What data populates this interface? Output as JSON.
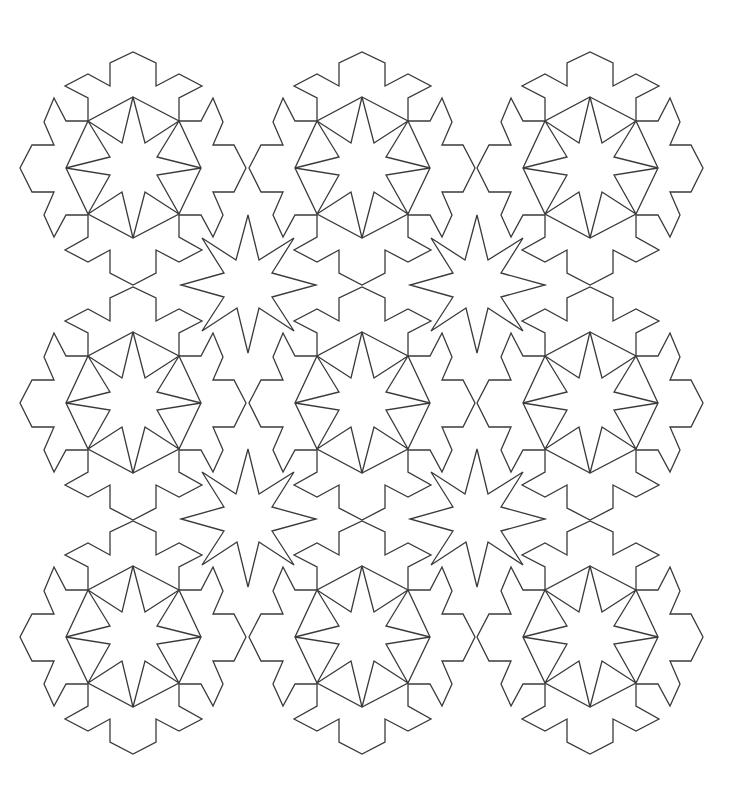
{
  "diagram": {
    "type": "geometric-tessellation",
    "background_color": "#ffffff",
    "line_color": "#3a3a3a",
    "line_width": 1.3,
    "rosettes": {
      "centers": [
        [
          133,
          168
        ],
        [
          362,
          168
        ],
        [
          590,
          168
        ],
        [
          133,
          403
        ],
        [
          362,
          403
        ],
        [
          590,
          403
        ],
        [
          133,
          637
        ],
        [
          362,
          637
        ],
        [
          590,
          637
        ]
      ],
      "octagon": [
        [
          0,
          -71
        ],
        [
          46,
          -47
        ],
        [
          68,
          0
        ],
        [
          46,
          46
        ],
        [
          0,
          70
        ],
        [
          -45,
          46
        ],
        [
          -67,
          0
        ],
        [
          -45,
          -47
        ]
      ],
      "inner_star": [
        [
          12,
          -25
        ],
        [
          24,
          -11
        ],
        [
          24,
          7
        ],
        [
          12,
          24
        ],
        [
          -11,
          24
        ],
        [
          -23,
          7
        ],
        [
          -23,
          -11
        ],
        [
          -11,
          -25
        ]
      ],
      "outline": [
        [
          -45,
          -47
        ],
        [
          -45,
          -70
        ],
        [
          -68,
          -82
        ],
        [
          -45,
          -94
        ],
        [
          -23,
          -82
        ],
        [
          -23,
          -105
        ],
        [
          0,
          -116
        ],
        [
          23,
          -105
        ],
        [
          23,
          -82
        ],
        [
          46,
          -94
        ],
        [
          69,
          -82
        ],
        [
          46,
          -70
        ],
        [
          46,
          -47
        ],
        [
          68,
          -47
        ],
        [
          80,
          -70
        ],
        [
          90,
          -46
        ],
        [
          80,
          -23
        ],
        [
          101,
          -23
        ],
        [
          113,
          0
        ],
        [
          101,
          24
        ],
        [
          80,
          24
        ],
        [
          90,
          47
        ],
        [
          80,
          69
        ],
        [
          68,
          47
        ],
        [
          46,
          47
        ],
        [
          46,
          69
        ],
        [
          69,
          82
        ],
        [
          46,
          94
        ],
        [
          23,
          82
        ],
        [
          23,
          105
        ],
        [
          0,
          117
        ],
        [
          -23,
          105
        ],
        [
          -23,
          82
        ],
        [
          -45,
          94
        ],
        [
          -68,
          82
        ],
        [
          -45,
          69
        ],
        [
          -45,
          47
        ],
        [
          -67,
          47
        ],
        [
          -79,
          69
        ],
        [
          -89,
          47
        ],
        [
          -79,
          24
        ],
        [
          -101,
          24
        ],
        [
          -113,
          0
        ],
        [
          -101,
          -23
        ],
        [
          -79,
          -23
        ],
        [
          -89,
          -46
        ],
        [
          -79,
          -70
        ],
        [
          -67,
          -47
        ],
        [
          -45,
          -47
        ]
      ]
    },
    "interstitial_stars": {
      "centers": [
        [
          248,
          285
        ],
        [
          477,
          285
        ],
        [
          248,
          519
        ],
        [
          477,
          519
        ]
      ],
      "points": 8,
      "outer_tips": [
        [
          0,
          -70
        ],
        [
          46,
          -47
        ],
        [
          68,
          0
        ],
        [
          46,
          46
        ],
        [
          0,
          68
        ],
        [
          -46,
          46
        ],
        [
          -67,
          0
        ],
        [
          -46,
          -47
        ]
      ],
      "inner_vertices": [
        [
          11,
          -25
        ],
        [
          24,
          -12
        ],
        [
          24,
          12
        ],
        [
          11,
          23
        ],
        [
          -11,
          23
        ],
        [
          -24,
          12
        ],
        [
          -24,
          -12
        ],
        [
          -12,
          -25
        ]
      ]
    }
  }
}
